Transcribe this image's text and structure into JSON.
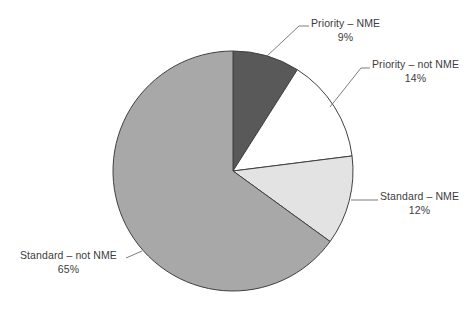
{
  "chart_data": {
    "type": "pie",
    "title": "",
    "subtitle": "",
    "xlabel": "",
    "ylabel": "",
    "grid": false,
    "legend_position": "none",
    "label_style": "callout-with-leader-lines",
    "start_angle_deg": 0,
    "direction": "clockwise",
    "categories": [
      "Priority – NME",
      "Priority – not NME",
      "Standard – NME",
      "Standard – not NME"
    ],
    "values": [
      9,
      14,
      12,
      65
    ],
    "value_unit": "percent",
    "value_labels": [
      "9%",
      "14%",
      "12%",
      "65%"
    ],
    "slices": [
      {
        "name": "Priority – NME",
        "value": 9,
        "value_label": "9%",
        "color": "#595959",
        "stroke": "#404040"
      },
      {
        "name": "Priority – not NME",
        "value": 14,
        "value_label": "14%",
        "color": "#ffffff",
        "stroke": "#404040"
      },
      {
        "name": "Standard – NME",
        "value": 12,
        "value_label": "12%",
        "color": "#e3e3e3",
        "stroke": "#404040"
      },
      {
        "name": "Standard – not NME",
        "value": 65,
        "value_label": "65%",
        "color": "#a8a8a8",
        "stroke": "#404040"
      }
    ]
  },
  "colors": {
    "background": "#ffffff",
    "text": "#3d3d3d",
    "leader_line": "#6e6e6e",
    "slice_outline": "#404040",
    "priority_nme": "#595959",
    "priority_not_nme": "#ffffff",
    "standard_nme": "#e3e3e3",
    "standard_not_nme": "#a8a8a8"
  },
  "labels": {
    "priority_nme": {
      "name": "Priority – NME",
      "pct": "9%"
    },
    "priority_not_nme": {
      "name": "Priority – not NME",
      "pct": "14%"
    },
    "standard_nme": {
      "name": "Standard – NME",
      "pct": "12%"
    },
    "standard_not_nme": {
      "name": "Standard – not NME",
      "pct": "65%"
    }
  }
}
